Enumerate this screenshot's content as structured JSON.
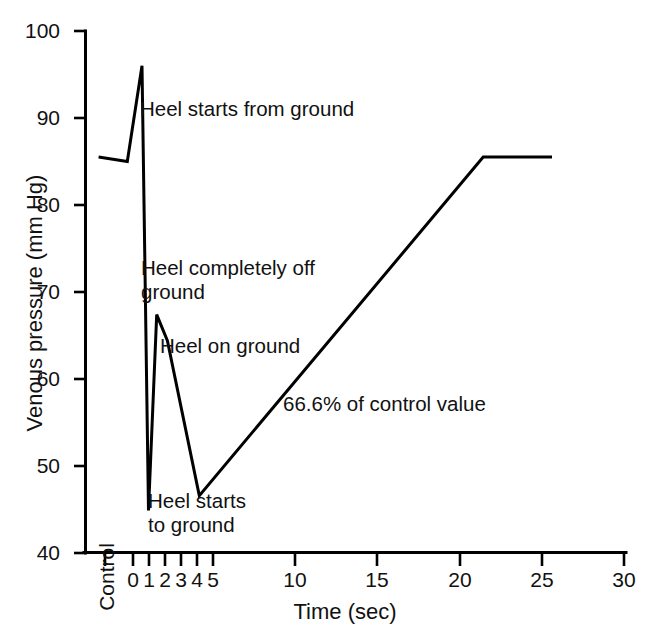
{
  "chart_data": {
    "type": "line",
    "title": "",
    "xlabel": "Time (sec)",
    "ylabel": "Venous pressure (mm Hg)",
    "xlim": [
      -2.2,
      30
    ],
    "ylim": [
      40,
      100
    ],
    "grid": false,
    "legend": "none",
    "y_ticks": [
      40,
      50,
      60,
      70,
      80,
      90,
      100
    ],
    "y_tick_labels": [
      "40",
      "50",
      "60",
      "70",
      "80",
      "90",
      "100"
    ],
    "x_ticks": [
      -1.6,
      0,
      1,
      2,
      3,
      4,
      5,
      10,
      15,
      20,
      25,
      30
    ],
    "x_tick_labels": [
      "Control",
      "0",
      "1",
      "2",
      "3",
      "4",
      "5",
      "10",
      "15",
      "20",
      "25",
      "30"
    ],
    "x_minor_ticks_note": "ticks at Control, 0, 1, 2, 3, 4, 5 then every 5 sec to 30",
    "series": [
      {
        "name": "Venous pressure",
        "x": [
          -2.1,
          -0.35,
          0.55,
          0.95,
          1.45,
          2.1,
          4.05,
          21.4,
          25.6
        ],
        "y": [
          85.5,
          85.0,
          96.0,
          44.9,
          67.4,
          64.4,
          46.6,
          85.5,
          85.5
        ]
      }
    ],
    "annotations": [
      {
        "id": "heel-starts-from-ground",
        "text": "Heel starts from ground",
        "x_px": 140,
        "y_px": 97
      },
      {
        "id": "heel-completely-off-ground",
        "text": "Heel completely off\nground",
        "x_px": 141,
        "y_px": 256
      },
      {
        "id": "heel-on-ground",
        "text": "Heel on ground",
        "x_px": 160,
        "y_px": 334
      },
      {
        "id": "percent-of-control-value",
        "text": "66.6% of control value",
        "x_px": 283,
        "y_px": 392
      },
      {
        "id": "heel-starts-to-ground",
        "text": "Heel starts\nto ground",
        "x_px": 148,
        "y_px": 489
      }
    ],
    "colors": {
      "line": "#000000",
      "axis": "#000000",
      "background": "#ffffff",
      "text": "#111111"
    }
  }
}
